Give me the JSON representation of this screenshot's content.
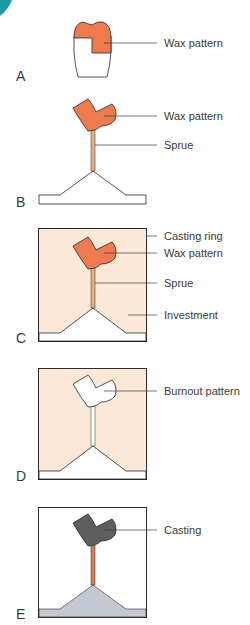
{
  "colors": {
    "wax": "#ee7a4e",
    "sprue": "#e9b07f",
    "investment": "#fbe8d6",
    "casting": "#5e5e5c",
    "casting_sprue": "#e07a45",
    "metal_base": "#c4c8d0",
    "outline": "#2a2a2a",
    "corner_accent": "#1a9aa8"
  },
  "panels": [
    {
      "letter": "A",
      "labels": [
        "Wax pattern"
      ]
    },
    {
      "letter": "B",
      "labels": [
        "Wax pattern",
        "Sprue"
      ]
    },
    {
      "letter": "C",
      "labels": [
        "Casting ring",
        "Wax pattern",
        "Sprue",
        "Investment"
      ]
    },
    {
      "letter": "D",
      "labels": [
        "Burnout pattern"
      ]
    },
    {
      "letter": "E",
      "labels": [
        "Casting"
      ]
    }
  ]
}
